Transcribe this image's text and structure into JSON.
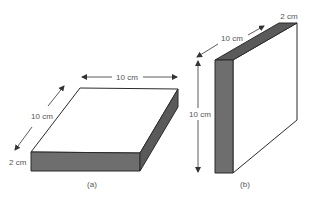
{
  "figures": [
    {
      "id": "a",
      "caption": "(a)",
      "description": "Flat slab lying horizontally",
      "dimensions": {
        "width": "10 cm",
        "depth": "10 cm",
        "thickness": "2 cm"
      }
    },
    {
      "id": "b",
      "caption": "(b)",
      "description": "Slab standing upright on edge",
      "dimensions": {
        "height": "10 cm",
        "depth": "10 cm",
        "thickness": "2 cm"
      }
    }
  ],
  "colors": {
    "edge": "#2b2b2b",
    "top_face": "#ffffff",
    "front_face": "#6e6e6e",
    "side_face": "#5a5a5a",
    "arrow": "#333333",
    "label": "#555555"
  }
}
